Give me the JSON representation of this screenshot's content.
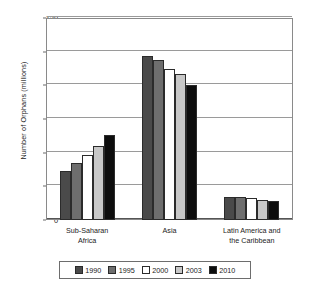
{
  "chart_data": {
    "type": "bar",
    "title": "",
    "xlabel": "",
    "ylabel": "Number of Orphans (millions)",
    "ylim": [
      0,
      120
    ],
    "yticks": [
      0,
      20,
      40,
      60,
      80,
      100,
      120
    ],
    "ytick_labels": [
      "0",
      "20",
      "40",
      "60",
      "80",
      "100",
      "120"
    ],
    "grid": true,
    "legend_position": "bottom",
    "categories": [
      "Sub-Saharan Africa",
      "Asia",
      "Latin America and the Caribbean"
    ],
    "category_lines": [
      [
        "Sub-Saharan",
        "Africa"
      ],
      [
        "Asia"
      ],
      [
        "Latin America and",
        "the Caribbean"
      ]
    ],
    "series": [
      {
        "name": "1990",
        "color": "#4a4a4a",
        "values": [
          29,
          97.5,
          13.5
        ]
      },
      {
        "name": "1995",
        "color": "#6e6e6e",
        "values": [
          34,
          95,
          13.5
        ]
      },
      {
        "name": "2000",
        "color": "#ffffff",
        "values": [
          38.5,
          90,
          13
        ]
      },
      {
        "name": "2003",
        "color": "#c8c8c8",
        "values": [
          44,
          87,
          12
        ]
      },
      {
        "name": "2010",
        "color": "#0d0d0d",
        "values": [
          50.5,
          80,
          11.5
        ]
      }
    ]
  }
}
